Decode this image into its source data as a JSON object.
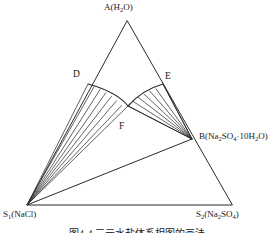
{
  "figure": {
    "type": "ternary-phase-diagram",
    "background_color": "#ffffff",
    "line_color": "#2b2b2b",
    "caption": "图4-4  三元水盐体系相图的画法"
  },
  "vertices": {
    "apex": {
      "name": "A",
      "label_html": "A(H<sub>2</sub>O)",
      "x": 127,
      "y": 21
    },
    "bottom_left": {
      "name": "S1",
      "label_html": "S<sub>1</sub>(NaCl)",
      "x": 27,
      "y": 205
    },
    "bottom_right": {
      "name": "S2",
      "label_html": "S<sub>2</sub>(Na<sub>2</sub>SO<sub>4</sub>)",
      "x": 232,
      "y": 205
    }
  },
  "points": {
    "B": {
      "label_html": "B(Na<sub>2</sub>SO<sub>4</sub>&middot;10H<sub>2</sub>O)",
      "x": 192,
      "y": 139
    },
    "D": {
      "label_html": "D",
      "x": 88,
      "y": 84
    },
    "E": {
      "label_html": "E",
      "x": 163,
      "y": 84
    },
    "F": {
      "label_html": "F",
      "x": 128,
      "y": 106
    }
  },
  "chart_data": {
    "type": "ternary",
    "title": "",
    "components": [
      "H2O",
      "NaCl",
      "Na2SO4"
    ],
    "labels": {
      "A": "A(H2O)",
      "S1": "S1(NaCl)",
      "S2": "S2(Na2SO4)",
      "B": "B(Na2SO4·10H2O)",
      "D": "D",
      "E": "E",
      "F": "F"
    },
    "triangle": [
      [
        127,
        21
      ],
      [
        27,
        205
      ],
      [
        232,
        205
      ]
    ],
    "solubility_curve_left": {
      "from": "D",
      "to": "F",
      "control": [
        118,
        96
      ]
    },
    "solubility_curve_right": {
      "from": "F",
      "to": "E",
      "control": [
        141,
        92
      ]
    },
    "tie_line_fans": [
      {
        "apex": "S1",
        "target_curve": "D-F",
        "count": 7
      },
      {
        "apex": "B",
        "target_curve": "F-E",
        "count": 7
      }
    ],
    "boundary_lines": [
      {
        "from": "S1",
        "to": "F"
      },
      {
        "from": "S1",
        "to": "B"
      },
      {
        "from": "B",
        "to": "S2"
      },
      {
        "from": "B",
        "to": "E"
      }
    ],
    "grid": false,
    "legend": null
  }
}
